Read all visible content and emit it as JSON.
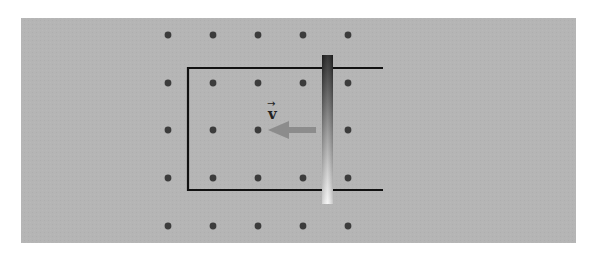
{
  "diagram": {
    "title": "",
    "colors": {
      "page_background": "#ffffff",
      "field_region": "#b5b5b5",
      "field_dot": "#3c3c3c",
      "rail": "#111111",
      "bar_top": "#1e1e1e",
      "bar_bottom": "#f5f5f5",
      "arrow": "#8c8c8c"
    },
    "field": {
      "direction": "out-of-page",
      "symbol": "dot",
      "rows": 5,
      "columns": 5
    },
    "velocity": {
      "label": "v",
      "vector_marker": "→",
      "direction": "left"
    }
  }
}
